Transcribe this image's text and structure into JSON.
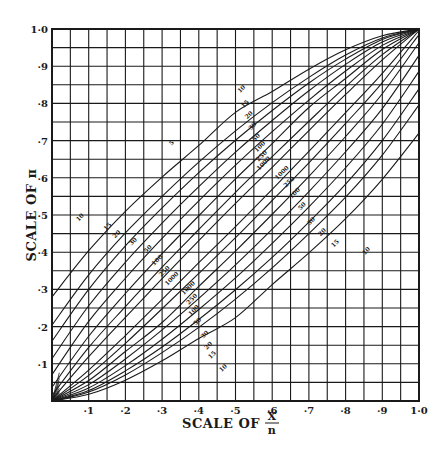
{
  "chart_data": {
    "type": "line",
    "title": "",
    "xlabel": "SCALE OF X/n",
    "xlabel_main": "SCALE OF",
    "xlabel_num": "X",
    "xlabel_den": "n",
    "ylabel": "SCALE OF π",
    "xlim": [
      0,
      1
    ],
    "ylim": [
      0,
      1
    ],
    "grid": true,
    "grid_minor_step": 0.05,
    "x_ticks": [
      "·1",
      "·2",
      "·3",
      "·4",
      "·5",
      "·6",
      "·7",
      "·8",
      "·9",
      "1·0"
    ],
    "y_ticks": [
      "·1",
      "·2",
      "·3",
      "·4",
      "·5",
      "·6",
      "·7",
      "·8",
      "·9",
      "1·0"
    ],
    "x": [
      0,
      0.1,
      0.2,
      0.3,
      0.4,
      0.5,
      0.6,
      0.7,
      0.8,
      0.9,
      1.0
    ],
    "series": [
      {
        "name": "10",
        "upper": [
          0.28,
          0.404,
          0.51,
          0.602,
          0.687,
          0.776,
          0.832,
          0.892,
          0.944,
          0.982,
          1.0
        ],
        "lower": [
          0,
          0.018,
          0.056,
          0.108,
          0.168,
          0.224,
          0.313,
          0.398,
          0.49,
          0.596,
          0.72
        ]
      },
      {
        "name": "15",
        "upper": [
          0.204,
          0.339,
          0.452,
          0.55,
          0.642,
          0.726,
          0.802,
          0.87,
          0.93,
          0.976,
          1.0
        ],
        "lower": [
          0,
          0.024,
          0.07,
          0.13,
          0.198,
          0.274,
          0.358,
          0.45,
          0.548,
          0.661,
          0.796
        ]
      },
      {
        "name": "20",
        "upper": [
          0.161,
          0.3,
          0.417,
          0.519,
          0.614,
          0.701,
          0.781,
          0.855,
          0.919,
          0.972,
          1.0
        ],
        "lower": [
          0,
          0.028,
          0.081,
          0.145,
          0.219,
          0.299,
          0.386,
          0.481,
          0.583,
          0.7,
          0.839
        ]
      },
      {
        "name": "30",
        "upper": [
          0.114,
          0.256,
          0.373,
          0.478,
          0.576,
          0.669,
          0.754,
          0.834,
          0.905,
          0.965,
          1.0
        ],
        "lower": [
          0,
          0.035,
          0.095,
          0.166,
          0.246,
          0.331,
          0.424,
          0.522,
          0.627,
          0.744,
          0.886
        ]
      },
      {
        "name": "50",
        "upper": [
          0.071,
          0.214,
          0.33,
          0.437,
          0.538,
          0.634,
          0.724,
          0.809,
          0.887,
          0.956,
          1.0
        ],
        "lower": [
          0,
          0.044,
          0.113,
          0.191,
          0.276,
          0.366,
          0.462,
          0.563,
          0.67,
          0.786,
          0.929
        ]
      },
      {
        "name": "100",
        "upper": [
          0.037,
          0.174,
          0.289,
          0.396,
          0.498,
          0.597,
          0.692,
          0.789,
          0.867,
          0.945,
          1.0
        ],
        "lower": [
          0,
          0.055,
          0.133,
          0.211,
          0.308,
          0.403,
          0.502,
          0.604,
          0.711,
          0.826,
          0.963
        ]
      },
      {
        "name": "250",
        "upper": [
          0.015,
          0.144,
          0.254,
          0.36,
          0.461,
          0.561,
          0.657,
          0.752,
          0.845,
          0.931,
          1.0
        ],
        "lower": [
          0,
          0.069,
          0.155,
          0.248,
          0.343,
          0.439,
          0.539,
          0.64,
          0.746,
          0.856,
          0.985
        ]
      },
      {
        "name": "1000",
        "upper": [
          0.004,
          0.119,
          0.225,
          0.329,
          0.431,
          0.531,
          0.628,
          0.727,
          0.824,
          0.917,
          1.0
        ],
        "lower": [
          0,
          0.083,
          0.176,
          0.273,
          0.372,
          0.469,
          0.569,
          0.671,
          0.775,
          0.881,
          0.996
        ]
      }
    ],
    "upper_labels": [
      {
        "text": "10",
        "x": 0.52,
        "y": 0.835
      },
      {
        "text": "15",
        "x": 0.53,
        "y": 0.795
      },
      {
        "text": "20",
        "x": 0.54,
        "y": 0.765
      },
      {
        "text": "30",
        "x": 0.55,
        "y": 0.735
      },
      {
        "text": "50",
        "x": 0.56,
        "y": 0.705
      },
      {
        "text": "100",
        "x": 0.57,
        "y": 0.68
      },
      {
        "text": "250",
        "x": 0.575,
        "y": 0.655
      },
      {
        "text": "1000",
        "x": 0.58,
        "y": 0.635
      },
      {
        "text": "5",
        "x": 0.33,
        "y": 0.69
      }
    ],
    "lower_labels": [
      {
        "text": "1000",
        "x": 0.63,
        "y": 0.61
      },
      {
        "text": "250",
        "x": 0.65,
        "y": 0.585
      },
      {
        "text": "100",
        "x": 0.665,
        "y": 0.555
      },
      {
        "text": "50",
        "x": 0.685,
        "y": 0.52
      },
      {
        "text": "30",
        "x": 0.71,
        "y": 0.48
      },
      {
        "text": "20",
        "x": 0.74,
        "y": 0.45
      },
      {
        "text": "15",
        "x": 0.775,
        "y": 0.42
      },
      {
        "text": "10",
        "x": 0.86,
        "y": 0.4
      }
    ],
    "left_labels": [
      {
        "text": "10",
        "x": 0.08,
        "y": 0.49
      },
      {
        "text": "15",
        "x": 0.155,
        "y": 0.465
      },
      {
        "text": "20",
        "x": 0.18,
        "y": 0.445
      },
      {
        "text": "30",
        "x": 0.225,
        "y": 0.425
      },
      {
        "text": "50",
        "x": 0.265,
        "y": 0.405
      },
      {
        "text": "100",
        "x": 0.29,
        "y": 0.375
      },
      {
        "text": "250",
        "x": 0.31,
        "y": 0.345
      },
      {
        "text": "1000",
        "x": 0.33,
        "y": 0.325
      }
    ],
    "bottom_labels": [
      {
        "text": "1000",
        "x": 0.375,
        "y": 0.3
      },
      {
        "text": "250",
        "x": 0.385,
        "y": 0.27
      },
      {
        "text": "100",
        "x": 0.39,
        "y": 0.24
      },
      {
        "text": "50",
        "x": 0.4,
        "y": 0.21
      },
      {
        "text": "30",
        "x": 0.42,
        "y": 0.175
      },
      {
        "text": "20",
        "x": 0.43,
        "y": 0.145
      },
      {
        "text": "15",
        "x": 0.44,
        "y": 0.12
      },
      {
        "text": "10",
        "x": 0.47,
        "y": 0.085
      }
    ],
    "colors": {
      "line": "#1a1a1a",
      "background": "#ffffff"
    }
  }
}
